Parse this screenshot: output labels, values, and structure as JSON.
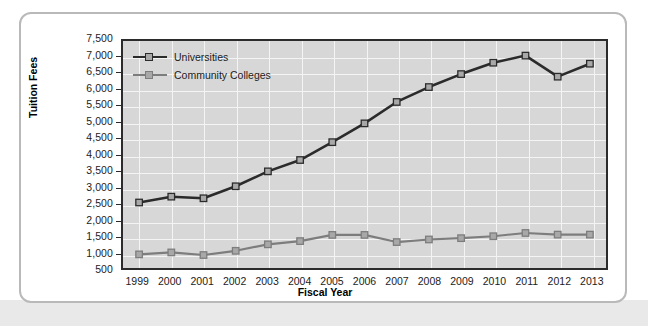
{
  "chart_data": {
    "type": "line",
    "title": "",
    "xlabel": "Fiscal Year",
    "ylabel": "Tuition Fees",
    "categories": [
      "1999",
      "2000",
      "2001",
      "2002",
      "2003",
      "2004",
      "2005",
      "2006",
      "2007",
      "2008",
      "2009",
      "2010",
      "2011",
      "2012",
      "2013"
    ],
    "ylim": [
      500,
      7500
    ],
    "ytick_step": 500,
    "ytick_labels": [
      "7,500",
      "7,000",
      "6,500",
      "6,000",
      "5,500",
      "5,000",
      "4,500",
      "4,000",
      "3,500",
      "3,000",
      "2,500",
      "2,000",
      "1,500",
      "1,000",
      "500"
    ],
    "ytick_values": [
      7500,
      7000,
      6500,
      6000,
      5500,
      5000,
      4500,
      4000,
      3500,
      3000,
      2500,
      2000,
      1500,
      1000,
      500
    ],
    "grid": true,
    "legend_position": "top-left",
    "series": [
      {
        "name": "Universities",
        "color": "#2b2b2b",
        "marker_fill": "#a8a8a8",
        "values": [
          2520,
          2700,
          2650,
          3020,
          3480,
          3830,
          4380,
          4960,
          5620,
          6080,
          6480,
          6830,
          7050,
          6400,
          6800
        ]
      },
      {
        "name": "Community Colleges",
        "color": "#7d7d7d",
        "marker_fill": "#a8a8a8",
        "values": [
          920,
          980,
          900,
          1030,
          1230,
          1330,
          1520,
          1520,
          1300,
          1380,
          1420,
          1480,
          1580,
          1530,
          1530
        ]
      }
    ],
    "plot_background": "#d7d7d7",
    "gridline_color": "#f4f4f4",
    "axis_color": "#2b2b2b"
  },
  "frame": {
    "card_border_color": "#b9b9b9",
    "page_background": "#ffffff"
  }
}
